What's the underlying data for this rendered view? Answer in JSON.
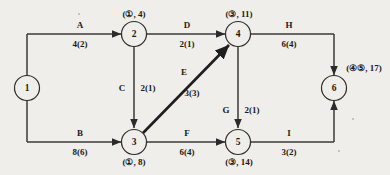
{
  "diagram": {
    "type": "activity-on-arrow-network",
    "nodes": [
      {
        "id": "1",
        "label": "1",
        "tag": "",
        "x": 27,
        "y": 88
      },
      {
        "id": "2",
        "label": "2",
        "tag": "(①, 4)",
        "x": 134,
        "y": 34
      },
      {
        "id": "3",
        "label": "3",
        "tag": "(①, 8)",
        "x": 134,
        "y": 142
      },
      {
        "id": "4",
        "label": "4",
        "tag": "(③, 11)",
        "x": 238,
        "y": 34
      },
      {
        "id": "5",
        "label": "5",
        "tag": "(③, 14)",
        "x": 238,
        "y": 142
      },
      {
        "id": "6",
        "label": "6",
        "tag": "(④⑤, 17)",
        "x": 334,
        "y": 88
      }
    ],
    "edges": [
      {
        "id": "A",
        "name": "A",
        "duration": "4(2)",
        "from": "1",
        "to": "2",
        "name_x": 80,
        "name_y": 25,
        "dur_x": 80,
        "dur_y": 44
      },
      {
        "id": "B",
        "name": "B",
        "duration": "8(6)",
        "from": "1",
        "to": "3",
        "name_x": 80,
        "name_y": 133,
        "dur_x": 80,
        "dur_y": 152
      },
      {
        "id": "C",
        "name": "C",
        "duration": "2(1)",
        "from": "2",
        "to": "3",
        "name_x": 122,
        "name_y": 88,
        "dur_x": 146,
        "dur_y": 88
      },
      {
        "id": "D",
        "name": "D",
        "duration": "2(1)",
        "from": "2",
        "to": "4",
        "name_x": 187,
        "name_y": 25,
        "dur_x": 187,
        "dur_y": 44
      },
      {
        "id": "E",
        "name": "E",
        "duration": "3(3)",
        "from": "3",
        "to": "4",
        "name_x": 184,
        "name_y": 72,
        "dur_x": 192,
        "dur_y": 93
      },
      {
        "id": "F",
        "name": "F",
        "duration": "6(4)",
        "from": "3",
        "to": "5",
        "name_x": 187,
        "name_y": 133,
        "dur_x": 187,
        "dur_y": 152
      },
      {
        "id": "G",
        "name": "G",
        "duration": "2(1)",
        "from": "4",
        "to": "5",
        "name_x": 226,
        "name_y": 110,
        "dur_x": 250,
        "dur_y": 110
      },
      {
        "id": "H",
        "name": "H",
        "duration": "6(4)",
        "from": "4",
        "to": "6",
        "name_x": 289,
        "name_y": 25,
        "dur_x": 289,
        "dur_y": 44
      },
      {
        "id": "I",
        "name": "I",
        "duration": "3(2)",
        "from": "5",
        "to": "6",
        "name_x": 289,
        "name_y": 133,
        "dur_x": 289,
        "dur_y": 152
      }
    ],
    "colors": {
      "background": "#efeeea",
      "stroke": "#3a3a3a",
      "text": "#1a1a1a"
    }
  }
}
